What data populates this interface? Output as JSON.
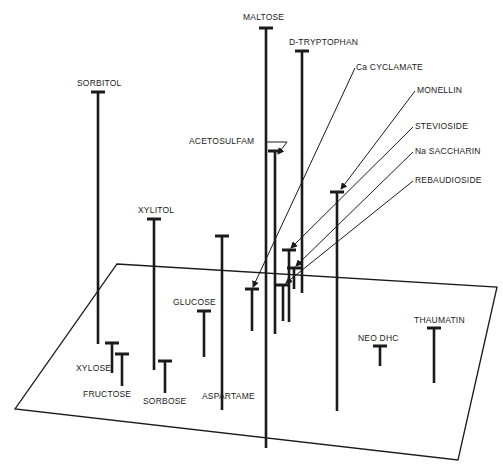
{
  "diagram": {
    "colors": {
      "ink": "#1a1a1a",
      "background": "#ffffff"
    },
    "plane": {
      "corners": [
        [
          117,
          264
        ],
        [
          497,
          287
        ],
        [
          458,
          460
        ],
        [
          15,
          409
        ]
      ]
    },
    "items": [
      {
        "name": "MALTOSE",
        "x": 266,
        "top": 28,
        "bottom": 448,
        "label_x": 243,
        "label_y": 12
      },
      {
        "name": "D-TRYPTOPHAN",
        "x": 302,
        "top": 51,
        "bottom": 293,
        "label_x": 289,
        "label_y": 37
      },
      {
        "name": "SORBITOL",
        "x": 98,
        "top": 92,
        "bottom": 344,
        "label_x": 77,
        "label_y": 78
      },
      {
        "name": "ACETOSULFAM",
        "x": 275,
        "top": 151,
        "bottom": 334,
        "label_x": 189,
        "label_y": 136
      },
      {
        "name": "XYLITOL",
        "x": 154,
        "top": 219,
        "bottom": 370,
        "label_x": 138,
        "label_y": 205
      },
      {
        "name": "ASPARTAME",
        "x": 222,
        "top": 236,
        "bottom": 410,
        "label_x": 202,
        "label_y": 391
      },
      {
        "name": "Ca CYCLAMATE",
        "x": 252,
        "top": 289,
        "bottom": 331,
        "label_x": 356,
        "label_y": 62
      },
      {
        "name": "MONELLIN",
        "x": 337,
        "top": 192,
        "bottom": 411,
        "label_x": 417,
        "label_y": 85
      },
      {
        "name": "STEVIOSIDE",
        "x": 289,
        "top": 250,
        "bottom": 322,
        "label_x": 415,
        "label_y": 121
      },
      {
        "name": "Na SACCHARIN",
        "x": 294,
        "top": 268,
        "bottom": 289,
        "label_x": 415,
        "label_y": 146
      },
      {
        "name": "REBAUDIOSIDE",
        "x": 283,
        "top": 285,
        "bottom": 321,
        "label_x": 415,
        "label_y": 175
      },
      {
        "name": "GLUCOSE",
        "x": 204,
        "top": 311,
        "bottom": 357,
        "label_x": 173,
        "label_y": 297
      },
      {
        "name": "XYLOSE",
        "x": 112,
        "top": 343,
        "bottom": 373,
        "label_x": 76,
        "label_y": 363
      },
      {
        "name": "FRUCTOSE",
        "x": 122,
        "top": 354,
        "bottom": 386,
        "label_x": 83,
        "label_y": 389
      },
      {
        "name": "SORBOSE",
        "x": 165,
        "top": 361,
        "bottom": 393,
        "label_x": 143,
        "label_y": 396
      },
      {
        "name": "NEO DHC",
        "x": 380,
        "top": 346,
        "bottom": 366,
        "label_x": 358,
        "label_y": 333
      },
      {
        "name": "THAUMATIN",
        "x": 434,
        "top": 328,
        "bottom": 383,
        "label_x": 414,
        "label_y": 315
      }
    ],
    "leaders": [
      {
        "for": "ACETOSULFAM",
        "from": [
          267,
          142
        ],
        "mid": [
          287,
          142
        ],
        "to": [
          278,
          154
        ]
      },
      {
        "for": "Ca CYCLAMATE",
        "from": [
          355,
          68
        ],
        "to": [
          253,
          287
        ]
      },
      {
        "for": "MONELLIN",
        "from": [
          415,
          91
        ],
        "to": [
          341,
          189
        ]
      },
      {
        "for": "STEVIOSIDE",
        "from": [
          413,
          127
        ],
        "to": [
          291,
          248
        ]
      },
      {
        "for": "Na SACCHARIN",
        "from": [
          413,
          152
        ],
        "to": [
          296,
          266
        ]
      },
      {
        "for": "REBAUDIOSIDE",
        "from": [
          413,
          181
        ],
        "to": [
          286,
          283
        ]
      }
    ]
  }
}
